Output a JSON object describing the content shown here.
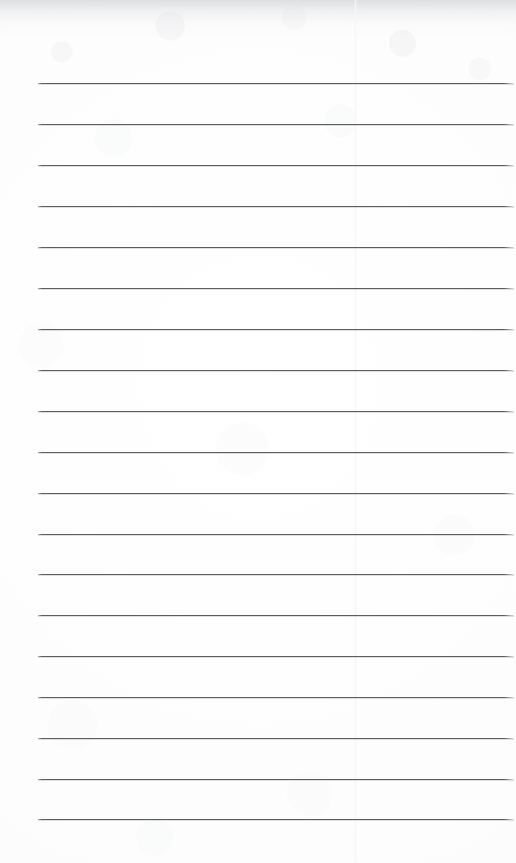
{
  "page": {
    "kind": "scanned-lined-notepad-page",
    "width": 516,
    "height": 863,
    "paper_color": "#fdfdfd",
    "has_handwriting": false,
    "has_text": false,
    "content_text": ""
  },
  "rules": {
    "label": "ruled-lines",
    "count": 19,
    "color": "#5a5d62",
    "thickness_px": 1.4,
    "left_x": 38,
    "right_x": 514,
    "first_y": 83,
    "spacing_y": 40.9,
    "y_positions": [
      83,
      124,
      165,
      206,
      247,
      288,
      329,
      370,
      411,
      452,
      493,
      534,
      574,
      615,
      656,
      697,
      738,
      779,
      819
    ]
  },
  "artifacts": {
    "top_scan_shadow": {
      "label": "scan-shadow-band",
      "height_px": 42,
      "color": "#c4c6ca"
    },
    "vertical_seam": {
      "label": "scan-seam",
      "x": 355,
      "color": "#f6f6f7"
    },
    "noise_label": "scan-speckle-texture"
  }
}
